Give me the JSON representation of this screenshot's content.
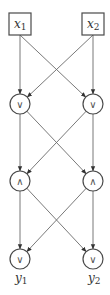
{
  "diagram": {
    "type": "logic-network",
    "colors": {
      "stroke": "#4a4a4a",
      "edge": "#6a6a6a",
      "text": "#333333",
      "background": "#ffffff"
    },
    "inputs": [
      {
        "id": "x1",
        "var": "x",
        "sub": "1",
        "cx": 20,
        "cy": 24
      },
      {
        "id": "x2",
        "var": "x",
        "sub": "2",
        "cx": 93,
        "cy": 24
      }
    ],
    "gates": [
      {
        "id": "g1",
        "op": "∨",
        "name": "or",
        "cx": 20,
        "cy": 104
      },
      {
        "id": "g2",
        "op": "∨",
        "name": "or",
        "cx": 93,
        "cy": 104
      },
      {
        "id": "g3",
        "op": "∧",
        "name": "and",
        "cx": 20,
        "cy": 181
      },
      {
        "id": "g4",
        "op": "∧",
        "name": "and",
        "cx": 93,
        "cy": 181
      },
      {
        "id": "g5",
        "op": "∨",
        "name": "or",
        "cx": 20,
        "cy": 259
      },
      {
        "id": "g6",
        "op": "∨",
        "name": "or",
        "cx": 93,
        "cy": 259
      }
    ],
    "outputs": [
      {
        "id": "y1",
        "var": "y",
        "sub": "1",
        "of": "g5"
      },
      {
        "id": "y2",
        "var": "y",
        "sub": "2",
        "of": "g6"
      }
    ],
    "edges": [
      [
        "x1",
        "g1"
      ],
      [
        "x1",
        "g2"
      ],
      [
        "x2",
        "g1"
      ],
      [
        "x2",
        "g2"
      ],
      [
        "g1",
        "g3"
      ],
      [
        "g1",
        "g4"
      ],
      [
        "g2",
        "g3"
      ],
      [
        "g2",
        "g4"
      ],
      [
        "g3",
        "g5"
      ],
      [
        "g3",
        "g6"
      ],
      [
        "g4",
        "g5"
      ],
      [
        "g4",
        "g6"
      ]
    ]
  }
}
